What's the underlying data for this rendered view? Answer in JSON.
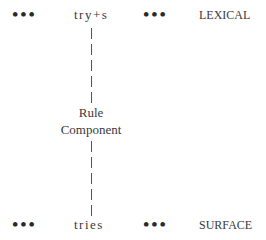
{
  "diagram": {
    "top_row": {
      "left_ellipsis": "•••",
      "form": "try+s",
      "right_ellipsis": "•••",
      "level_label": "LEXICAL"
    },
    "middle": {
      "line1": "Rule",
      "line2": "Component"
    },
    "bottom_row": {
      "left_ellipsis": "•••",
      "form": "tries",
      "right_ellipsis": "•••",
      "level_label": "SURFACE"
    }
  }
}
